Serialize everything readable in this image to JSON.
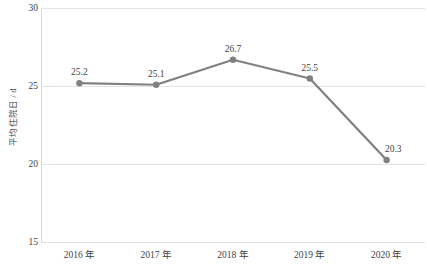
{
  "chart_data": {
    "type": "line",
    "title": "",
    "subtitle": "",
    "xlabel": "",
    "ylabel": "平均住院日 / d",
    "categories": [
      "2016 年",
      "2017 年",
      "2018 年",
      "2019 年",
      "2020 年"
    ],
    "values": [
      25.2,
      25.1,
      26.7,
      25.5,
      20.3
    ],
    "point_labels": [
      "25.2",
      "25.1",
      "26.7",
      "25.5",
      "20.3"
    ],
    "series": [
      {
        "name": "平均住院日",
        "values": [
          25.2,
          25.1,
          26.7,
          25.5,
          20.3
        ]
      }
    ],
    "ylim": [
      15,
      30
    ],
    "yticks": [
      30,
      25,
      20,
      15
    ],
    "ytick_labels": [
      "30",
      "25",
      "20",
      "15"
    ],
    "grid": true,
    "legend": "none",
    "colors": {
      "line": "#808080",
      "marker": "#808080",
      "gridline": "#e2e2e2",
      "axis": "#d9d9d9",
      "text": "#3f3f3f",
      "background": "#ffffff"
    }
  }
}
